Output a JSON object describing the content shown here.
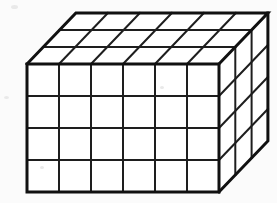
{
  "figure": {
    "shape_name": "rectangular-prism",
    "projection": "oblique",
    "caption": ""
  },
  "colors": {
    "background": "#fbfbfb",
    "face_fill": "#ffffff",
    "grid_line": "#1e1e1e",
    "outer_edge": "#111111"
  },
  "chart_data": {
    "type": "diagram",
    "shape": "rectangular prism",
    "units": "unit cubes",
    "dimensions": {
      "width_columns": 6,
      "height_rows": 4,
      "depth_layers": 3
    },
    "total_unit_cubes": 72,
    "faces": [
      {
        "name": "front",
        "columns": 6,
        "rows": 4,
        "visible_cells": 24
      },
      {
        "name": "top",
        "columns": 6,
        "rows": 3,
        "visible_cells": 18
      },
      {
        "name": "right",
        "columns": 3,
        "rows": 4,
        "visible_cells": 12
      }
    ],
    "geometry": {
      "front_left_x": 27,
      "front_top_y": 64,
      "cell_width": 32,
      "cell_height": 32,
      "depth_step_x": 16.3,
      "depth_step_y": -17.0
    },
    "labels": [],
    "annotations": []
  }
}
